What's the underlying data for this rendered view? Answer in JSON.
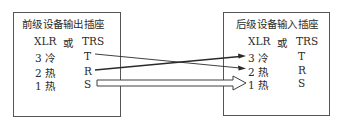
{
  "left_box": {
    "title": "前级设备输出插座",
    "header_xlr": "XLR",
    "header_or": "或",
    "header_trs": "TRS",
    "rows": [
      {
        "xlr": "3 冷",
        "trs": "T"
      },
      {
        "xlr": "2 热",
        "trs": "R"
      },
      {
        "xlr": "1 热",
        "trs": "S"
      }
    ]
  },
  "right_box": {
    "title": "后级设备输入插座",
    "header_xlr": "XLR",
    "header_or": "或",
    "header_trs": "TRS",
    "rows": [
      {
        "xlr": "3 冷",
        "trs": "T"
      },
      {
        "xlr": "2 热",
        "trs": "R"
      },
      {
        "xlr": "1 热",
        "trs": "S"
      }
    ]
  },
  "connections": [
    {
      "from": "T",
      "to": "2 热",
      "style": "thin-arrow"
    },
    {
      "from": "R",
      "to": "3 冷",
      "style": "thick-arrow"
    },
    {
      "from": "S",
      "to": "1 热",
      "style": "hollow-block-arrow"
    }
  ],
  "colors": {
    "line": "#2a2a2a",
    "border": "#555555",
    "background": "#ffffff"
  }
}
